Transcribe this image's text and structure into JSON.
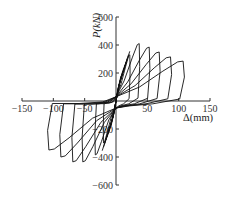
{
  "chart_data": {
    "type": "line",
    "title": "",
    "xlabel": "Δ(mm)",
    "ylabel": "P(kN)",
    "xlim": [
      -150,
      150
    ],
    "ylim": [
      -600,
      600
    ],
    "x_ticks": [
      -150,
      -100,
      -50,
      0,
      50,
      100,
      150
    ],
    "x_tick_labels": [
      "−150",
      "−100",
      "−50",
      "",
      "50",
      "100",
      "150"
    ],
    "y_ticks": [
      -600,
      -400,
      -200,
      200,
      400,
      600
    ],
    "y_tick_labels": [
      "−600",
      "−400",
      "−200",
      "200",
      "400",
      "600"
    ],
    "grid": false,
    "legend": null,
    "series": [
      {
        "name": "cycle-1",
        "peak_pos": [
          22,
          330
        ],
        "peak_neg": [
          -20,
          -300
        ]
      },
      {
        "name": "cycle-2",
        "peak_pos": [
          37,
          410
        ],
        "peak_neg": [
          -33,
          -385
        ]
      },
      {
        "name": "cycle-3",
        "peak_pos": [
          53,
          385
        ],
        "peak_neg": [
          -53,
          -435
        ]
      },
      {
        "name": "cycle-4",
        "peak_pos": [
          69,
          350
        ],
        "peak_neg": [
          -69,
          -435
        ]
      },
      {
        "name": "cycle-5",
        "peak_pos": [
          87,
          315
        ],
        "peak_neg": [
          -88,
          -400
        ]
      },
      {
        "name": "cycle-6",
        "peak_pos": [
          107,
          285
        ],
        "peak_neg": [
          -107,
          -350
        ]
      }
    ]
  },
  "labels": {
    "x_axis": "Δ(mm)",
    "y_axis": "P(kN)"
  }
}
